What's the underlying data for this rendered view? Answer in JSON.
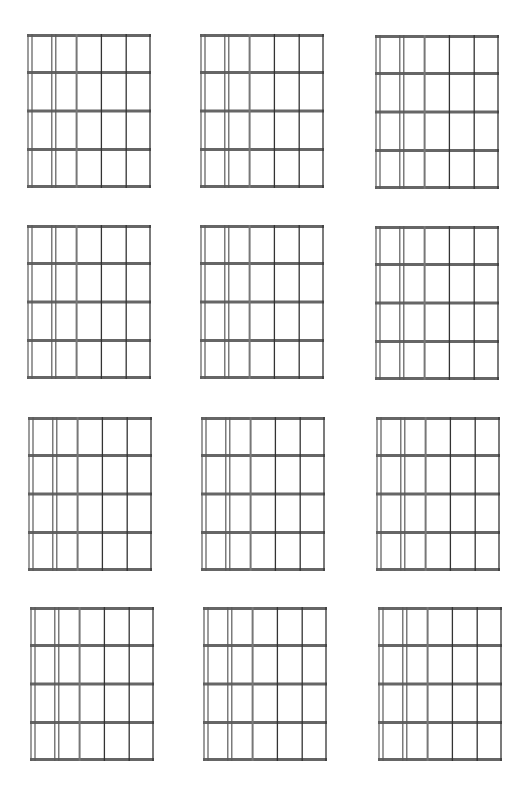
{
  "page": {
    "background": "#ffffff",
    "line_color": "#5a5a5a",
    "fret_color": "#666666"
  },
  "grid": {
    "strings": 6,
    "frets": 4,
    "rows": 4,
    "cols": 3
  },
  "diagrams": [
    {
      "row": 1,
      "col": 1,
      "x": 27,
      "y": 34
    },
    {
      "row": 1,
      "col": 2,
      "x": 200,
      "y": 34
    },
    {
      "row": 1,
      "col": 3,
      "x": 375,
      "y": 35
    },
    {
      "row": 2,
      "col": 1,
      "x": 27,
      "y": 225
    },
    {
      "row": 2,
      "col": 2,
      "x": 200,
      "y": 225
    },
    {
      "row": 2,
      "col": 3,
      "x": 375,
      "y": 226
    },
    {
      "row": 3,
      "col": 1,
      "x": 28,
      "y": 417
    },
    {
      "row": 3,
      "col": 2,
      "x": 201,
      "y": 417
    },
    {
      "row": 3,
      "col": 3,
      "x": 376,
      "y": 417
    },
    {
      "row": 4,
      "col": 1,
      "x": 30,
      "y": 607
    },
    {
      "row": 4,
      "col": 2,
      "x": 203,
      "y": 607
    },
    {
      "row": 4,
      "col": 3,
      "x": 378,
      "y": 607
    }
  ]
}
